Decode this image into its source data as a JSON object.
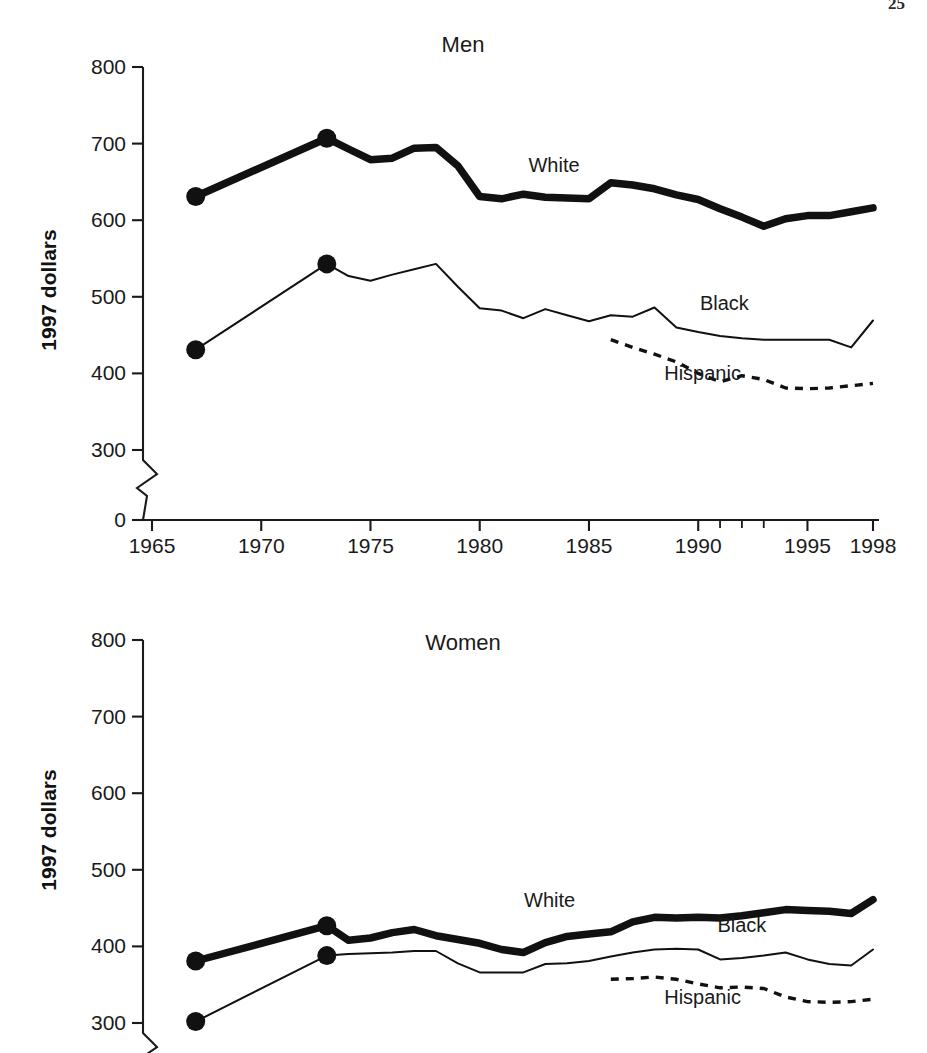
{
  "page": {
    "number": "25",
    "background": "#ffffff",
    "ink_color": "#111111"
  },
  "chart_data": [
    {
      "type": "line",
      "title": "Men",
      "xlabel": "",
      "ylabel": "1997 dollars",
      "xlim": [
        1965,
        1998
      ],
      "ylim": [
        0,
        800
      ],
      "y_axis_break": true,
      "y_break_range": [
        0,
        300
      ],
      "grid": false,
      "legend_position": "inline-labels",
      "ytick_labels": [
        "800",
        "700",
        "600",
        "500",
        "400",
        "300",
        "0"
      ],
      "ytick_values": [
        800,
        700,
        600,
        500,
        400,
        300,
        0
      ],
      "xtick_labels": [
        "1965",
        "1970",
        "1975",
        "1980",
        "1985",
        "1990",
        "1995",
        "1998"
      ],
      "xtick_values": [
        1965,
        1970,
        1975,
        1980,
        1985,
        1990,
        1995,
        1998
      ],
      "series": [
        {
          "name": "White",
          "style": "thick-solid",
          "label_x": 1983.4,
          "label_y": 663,
          "markers_x": [
            1967,
            1973
          ],
          "x": [
            1967,
            1973,
            1974,
            1975,
            1976,
            1977,
            1978,
            1979,
            1980,
            1981,
            1982,
            1983,
            1984,
            1985,
            1986,
            1987,
            1988,
            1989,
            1990,
            1991,
            1992,
            1993,
            1994,
            1995,
            1996,
            1997,
            1998
          ],
          "values": [
            631,
            707,
            693,
            679,
            681,
            694,
            695,
            671,
            631,
            628,
            634,
            630,
            629,
            628,
            649,
            646,
            641,
            633,
            627,
            615,
            604,
            592,
            602,
            606,
            606,
            611,
            616
          ]
        },
        {
          "name": "Black",
          "style": "thin-solid",
          "label_x": 1991.2,
          "label_y": 483,
          "markers_x": [
            1967,
            1973
          ],
          "x": [
            1967,
            1973,
            1974,
            1975,
            1976,
            1977,
            1978,
            1979,
            1980,
            1981,
            1982,
            1983,
            1984,
            1985,
            1986,
            1987,
            1988,
            1989,
            1990,
            1991,
            1992,
            1993,
            1994,
            1995,
            1996,
            1997,
            1998
          ],
          "values": [
            431,
            543,
            527,
            521,
            529,
            536,
            543,
            513,
            485,
            482,
            472,
            484,
            476,
            468,
            476,
            474,
            486,
            460,
            454,
            449,
            446,
            444,
            444,
            444,
            444,
            434,
            469
          ]
        },
        {
          "name": "Hispanic",
          "style": "dotted",
          "label_x": 1990.2,
          "label_y": 391,
          "markers_x": [],
          "x": [
            1986,
            1987,
            1988,
            1989,
            1990,
            1991,
            1992,
            1993,
            1994,
            1995,
            1996,
            1997,
            1998
          ],
          "values": [
            444,
            434,
            425,
            415,
            400,
            389,
            397,
            392,
            381,
            380,
            381,
            384,
            387
          ]
        }
      ]
    },
    {
      "type": "line",
      "title": "Women",
      "xlabel": "",
      "ylabel": "1997 dollars",
      "xlim": [
        1965,
        1998
      ],
      "ylim": [
        0,
        800
      ],
      "y_axis_break": true,
      "y_break_range": [
        0,
        300
      ],
      "grid": false,
      "legend_position": "inline-labels",
      "ytick_labels": [
        "800",
        "700",
        "600",
        "500",
        "400",
        "300"
      ],
      "ytick_values": [
        800,
        700,
        600,
        500,
        400,
        300
      ],
      "xtick_labels": [],
      "xtick_values": [],
      "series": [
        {
          "name": "White",
          "style": "thick-solid",
          "label_x": 1983.2,
          "label_y": 452,
          "markers_x": [
            1967,
            1973
          ],
          "x": [
            1967,
            1973,
            1974,
            1975,
            1976,
            1977,
            1978,
            1979,
            1980,
            1981,
            1982,
            1983,
            1984,
            1985,
            1986,
            1987,
            1988,
            1989,
            1990,
            1991,
            1992,
            1993,
            1994,
            1995,
            1996,
            1997,
            1998
          ],
          "values": [
            381,
            427,
            408,
            411,
            418,
            422,
            414,
            409,
            404,
            396,
            392,
            405,
            413,
            416,
            419,
            432,
            438,
            437,
            438,
            437,
            440,
            444,
            448,
            447,
            446,
            443,
            461
          ]
        },
        {
          "name": "Black",
          "style": "thin-solid",
          "label_x": 1992.0,
          "label_y": 419,
          "markers_x": [
            1967,
            1973
          ],
          "x": [
            1967,
            1973,
            1974,
            1975,
            1976,
            1977,
            1978,
            1979,
            1980,
            1981,
            1982,
            1983,
            1984,
            1985,
            1986,
            1987,
            1988,
            1989,
            1990,
            1991,
            1992,
            1993,
            1994,
            1995,
            1996,
            1997,
            1998
          ],
          "values": [
            302,
            388,
            390,
            391,
            392,
            394,
            394,
            378,
            366,
            366,
            366,
            377,
            378,
            381,
            387,
            392,
            396,
            397,
            396,
            383,
            385,
            388,
            392,
            383,
            377,
            375,
            396
          ]
        },
        {
          "name": "Hispanic",
          "style": "dotted",
          "label_x": 1990.2,
          "label_y": 325,
          "markers_x": [],
          "x": [
            1986,
            1987,
            1988,
            1989,
            1990,
            1991,
            1992,
            1993,
            1994,
            1995,
            1996,
            1997,
            1998
          ],
          "values": [
            357,
            358,
            360,
            357,
            351,
            346,
            347,
            345,
            334,
            328,
            327,
            328,
            331
          ]
        }
      ]
    }
  ]
}
